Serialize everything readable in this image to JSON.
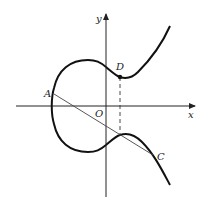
{
  "diagram": {
    "type": "elliptic-curve-graph",
    "axes": {
      "x_label": "x",
      "y_label": "y",
      "origin_label": "O"
    },
    "points": [
      {
        "label": "A",
        "x": 54,
        "y": 94
      },
      {
        "label": "C",
        "x": 153,
        "y": 155
      },
      {
        "label": "D",
        "x": 120,
        "y": 76
      }
    ],
    "colors": {
      "curve": "#111111",
      "axes": "#222222",
      "line": "#444444"
    }
  }
}
